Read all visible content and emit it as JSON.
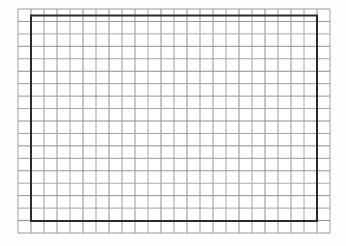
{
  "page": {
    "background_color": "#fdfdfd",
    "width": 346,
    "height": 246
  },
  "figure": {
    "grid": {
      "x": 18,
      "y": 9,
      "width": 312,
      "height": 224,
      "columns": 24,
      "rows": 18,
      "line_width": 1,
      "line_colors": [
        "#a3a3a3",
        "#8e8e8e",
        "#9b9b9b",
        "#959595",
        "#a8a8a8",
        "#909090"
      ],
      "cell_fill": "#ffffff"
    },
    "rectangle": {
      "x": 31,
      "y": 15.5,
      "width": 286,
      "height": 205.5,
      "stroke_color": "#2a2a2a",
      "stroke_width": 2,
      "fill": "none"
    }
  }
}
